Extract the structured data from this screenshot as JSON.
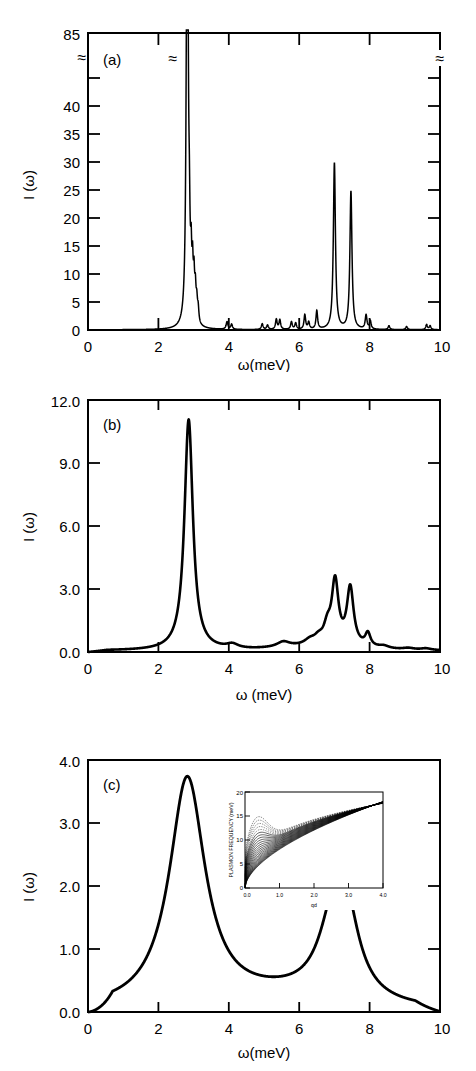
{
  "figure": {
    "background": "#ffffff",
    "line_color": "#000000"
  },
  "chart_data": [
    {
      "id": "panel-a",
      "type": "line",
      "panel_label": "(a)",
      "title": "",
      "xlabel": "ω(meV)",
      "ylabel": "I (ω)",
      "xlim": [
        0,
        10
      ],
      "ylim": [
        0,
        45
      ],
      "xticks": [
        0,
        2,
        4,
        6,
        8,
        10
      ],
      "xticklabels": [
        "0",
        "2",
        "4",
        "6",
        "8",
        "10"
      ],
      "xminorticks": [
        1,
        3,
        5,
        7,
        9
      ],
      "yticks": [
        0,
        5,
        10,
        15,
        20,
        25,
        30,
        35,
        40
      ],
      "yticklabels": [
        "0",
        "5",
        "10",
        "15",
        "20",
        "25",
        "30",
        "35",
        "40"
      ],
      "ytop_label": "85",
      "axis_break": {
        "present": true,
        "glyph": "≈",
        "between": [
          40,
          85
        ],
        "locations": [
          "left-axis",
          "main-peak",
          "right-axis"
        ],
        "note": "y axis broken; tall peak at 2.82 meV reaches 85"
      },
      "grid": false,
      "legend": null,
      "peaks": [
        {
          "x": 2.82,
          "height": 85.0,
          "width": 0.03,
          "label": "main plasmon, clipped by axis break"
        },
        {
          "x": 2.88,
          "height": 9.2,
          "width": 0.022
        },
        {
          "x": 2.93,
          "height": 7.6,
          "width": 0.02
        },
        {
          "x": 2.97,
          "height": 6.9,
          "width": 0.02
        },
        {
          "x": 3.01,
          "height": 6.2,
          "width": 0.022
        },
        {
          "x": 3.05,
          "height": 4.4,
          "width": 0.022
        },
        {
          "x": 3.09,
          "height": 3.0,
          "width": 0.024
        },
        {
          "x": 3.13,
          "height": 2.1,
          "width": 0.024
        },
        {
          "x": 3.95,
          "height": 1.2,
          "width": 0.03
        },
        {
          "x": 4.08,
          "height": 0.8,
          "width": 0.028
        },
        {
          "x": 4.95,
          "height": 0.9,
          "width": 0.028
        },
        {
          "x": 5.1,
          "height": 0.7,
          "width": 0.028
        },
        {
          "x": 5.35,
          "height": 1.6,
          "width": 0.028
        },
        {
          "x": 5.45,
          "height": 1.5,
          "width": 0.028
        },
        {
          "x": 5.78,
          "height": 1.2,
          "width": 0.028
        },
        {
          "x": 5.9,
          "height": 1.0,
          "width": 0.028
        },
        {
          "x": 6.16,
          "height": 2.3,
          "width": 0.028
        },
        {
          "x": 6.27,
          "height": 1.1,
          "width": 0.028
        },
        {
          "x": 6.5,
          "height": 2.9,
          "width": 0.028
        },
        {
          "x": 7.0,
          "height": 26.4,
          "width": 0.035
        },
        {
          "x": 7.47,
          "height": 21.9,
          "width": 0.035
        },
        {
          "x": 7.9,
          "height": 2.2,
          "width": 0.03
        },
        {
          "x": 8.02,
          "height": 1.3,
          "width": 0.028
        },
        {
          "x": 8.55,
          "height": 0.6,
          "width": 0.028
        },
        {
          "x": 9.05,
          "height": 0.5,
          "width": 0.028
        },
        {
          "x": 9.62,
          "height": 0.8,
          "width": 0.028
        },
        {
          "x": 9.72,
          "height": 0.6,
          "width": 0.028
        }
      ]
    },
    {
      "id": "panel-b",
      "type": "line",
      "panel_label": "(b)",
      "title": "",
      "xlabel": "ω (meV)",
      "ylabel": "I (ω)",
      "xlim": [
        0,
        10
      ],
      "ylim": [
        0.0,
        12.0
      ],
      "xticks": [
        0,
        2,
        4,
        6,
        8,
        10
      ],
      "xticklabels": [
        "0",
        "2",
        "4",
        "6",
        "8",
        "10"
      ],
      "yticks": [
        0.0,
        3.0,
        6.0,
        9.0,
        12.0
      ],
      "yticklabels": [
        "0.0",
        "3.0",
        "6.0",
        "9.0",
        "12.0"
      ],
      "grid": false,
      "legend": null,
      "peaks": [
        {
          "x": 2.86,
          "height": 11.0,
          "width": 0.145,
          "label": "main plasmon"
        },
        {
          "x": 7.02,
          "height": 3.0,
          "width": 0.115
        },
        {
          "x": 7.45,
          "height": 2.75,
          "width": 0.115
        },
        {
          "x": 6.8,
          "height": 0.75,
          "width": 0.12
        },
        {
          "x": 7.95,
          "height": 0.62,
          "width": 0.09
        },
        {
          "x": 5.55,
          "height": 0.25,
          "width": 0.22
        },
        {
          "x": 6.3,
          "height": 0.22,
          "width": 0.18
        },
        {
          "x": 6.55,
          "height": 0.3,
          "width": 0.16
        },
        {
          "x": 4.1,
          "height": 0.2,
          "width": 0.2
        },
        {
          "x": 8.4,
          "height": 0.12,
          "width": 0.18
        },
        {
          "x": 9.1,
          "height": 0.08,
          "width": 0.2
        },
        {
          "x": 9.6,
          "height": 0.08,
          "width": 0.18
        }
      ],
      "baseline": 0.06
    },
    {
      "id": "panel-c",
      "type": "line",
      "panel_label": "(c)",
      "title": "",
      "xlabel": "ω(meV)",
      "ylabel": "I (ω)",
      "xlim": [
        0,
        10
      ],
      "ylim": [
        0.0,
        4.0
      ],
      "xticks": [
        0,
        2,
        4,
        6,
        8,
        10
      ],
      "xticklabels": [
        "0",
        "2",
        "4",
        "6",
        "8",
        "10"
      ],
      "yticks": [
        0.0,
        1.0,
        2.0,
        3.0,
        4.0
      ],
      "yticklabels": [
        "0.0",
        "1.0",
        "2.0",
        "3.0",
        "4.0"
      ],
      "grid": false,
      "legend": null,
      "peaks": [
        {
          "x": 2.82,
          "height": 3.65,
          "width": 0.62,
          "label": "broad main plasmon band"
        },
        {
          "x": 7.0,
          "height": 1.12,
          "width": 0.52
        },
        {
          "x": 7.32,
          "height": 1.1,
          "width": 0.45
        }
      ],
      "valley": {
        "x": 4.9,
        "height": 0.22
      },
      "baseline": 0.03
    },
    {
      "id": "panel-c-inset",
      "type": "line",
      "title": "",
      "xlabel": "qd",
      "ylabel": "PLASMON FREQUENCY (meV)",
      "xlim": [
        0.0,
        4.0
      ],
      "ylim": [
        0,
        20
      ],
      "xticks": [
        0.0,
        1.0,
        2.0,
        3.0,
        4.0
      ],
      "xticklabels": [
        "0.0",
        "1.0",
        "2.0",
        "3.0",
        "4.0"
      ],
      "yticks": [
        0,
        5,
        10,
        15,
        20
      ],
      "yticklabels": [
        "0",
        "5",
        "10",
        "15",
        "20"
      ],
      "grid": false,
      "legend": null,
      "description": "Dense bundle of plasmon dispersion branches fanning out from the origin, all rising monotonically and converging toward ~18 meV at qd = 4.0; a dashed upper envelope peaks near qd = 0.35 at ~10 meV.",
      "n_branches": 26,
      "envelope_top": {
        "x": 0.35,
        "y": 10.0
      },
      "converge_at": {
        "x": 4.0,
        "y": 18.0
      }
    }
  ]
}
